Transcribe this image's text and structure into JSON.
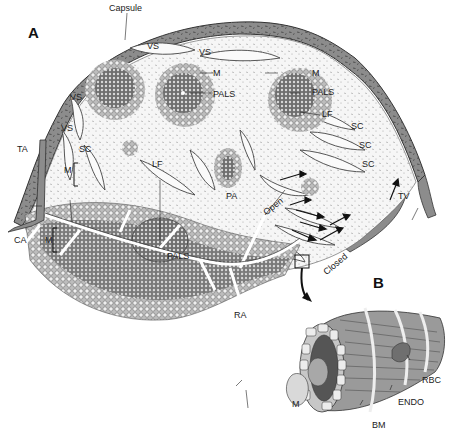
{
  "figure": {
    "panels": {
      "a": "A",
      "b": "B"
    },
    "panel_a_labels": {
      "capsule": "Capsule",
      "vs1": "VS",
      "vs2": "VS",
      "vs3": "VS",
      "vs4": "VS",
      "m1": "M",
      "pals1": "PALS",
      "m2": "M",
      "pals2": "PALS",
      "lf1": "LF",
      "sc1": "SC",
      "sc2": "SC",
      "sc3": "SC",
      "sc4": "SC",
      "ta": "TA",
      "m3": "M",
      "lf2": "LF",
      "pa": "PA",
      "open": "Open",
      "tv": "TV",
      "ca": "CA",
      "m4": "M",
      "pals3": "PALS",
      "closed": "Closed",
      "ra": "RA"
    },
    "panel_b_labels": {
      "rbc": "RBC",
      "endo": "ENDO",
      "m": "M",
      "bm": "BM"
    },
    "colors": {
      "capsule_fill": "#8a8a8a",
      "pulp_bg": "#f4f4f4",
      "white_pulp_dark": "#6a6a6a",
      "endothelium": "#9a9a9a",
      "lumen_dark": "#555555",
      "basement_membrane": "#e8e8e8",
      "rbc": "#6f6f6f"
    }
  }
}
